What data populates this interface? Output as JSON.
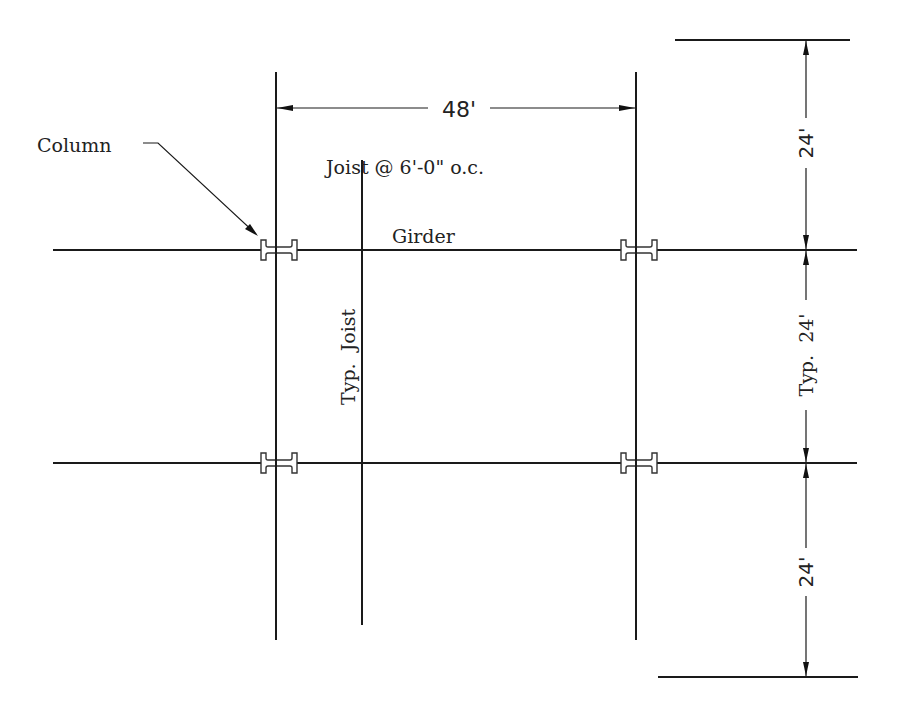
{
  "diagram": {
    "type": "structural framing plan",
    "colors": {
      "line": "#1a1a1a",
      "text": "#222222",
      "background": "#ffffff"
    },
    "labels": {
      "column": "Column",
      "joist_spacing": "Joist @ 6'-0\" o.c.",
      "girder": "Girder",
      "typ_joist": "Typ.  Joist"
    },
    "dimensions": {
      "span_horizontal": "48'",
      "bay_top": "24'",
      "bay_middle": "Typ.  24'",
      "bay_bottom": "24'"
    },
    "elements": {
      "columns": [
        {
          "id": "column-top-left"
        },
        {
          "id": "column-top-right"
        },
        {
          "id": "column-bottom-left"
        },
        {
          "id": "column-bottom-right"
        }
      ],
      "girders": [
        "girder-top",
        "girder-bottom"
      ],
      "grid_lines": [
        "grid-line-left",
        "grid-line-right"
      ],
      "joists": [
        "typical-joist"
      ]
    }
  }
}
